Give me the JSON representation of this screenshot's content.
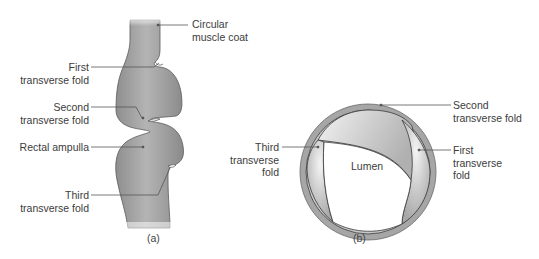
{
  "figure_a": {
    "caption": "(a)",
    "labels": {
      "circular_muscle_coat": [
        "Circular",
        "muscle coat"
      ],
      "first_fold": [
        "First",
        "transverse fold"
      ],
      "second_fold": [
        "Second",
        "transverse fold"
      ],
      "rectal_ampulla": [
        "Rectal ampulla"
      ],
      "third_fold": [
        "Third",
        "transverse fold"
      ]
    }
  },
  "figure_b": {
    "caption": "(b)",
    "labels": {
      "third_fold": [
        "Third",
        "transverse",
        "fold"
      ],
      "lumen": "Lumen",
      "second_fold": [
        "Second",
        "transverse fold"
      ],
      "first_fold": [
        "First",
        "transverse",
        "fold"
      ]
    }
  },
  "colors": {
    "tissue": "#9a9a9a",
    "tissue_light": "#c4c4c4",
    "outline": "#4a4a4a",
    "leader": "#555555"
  }
}
